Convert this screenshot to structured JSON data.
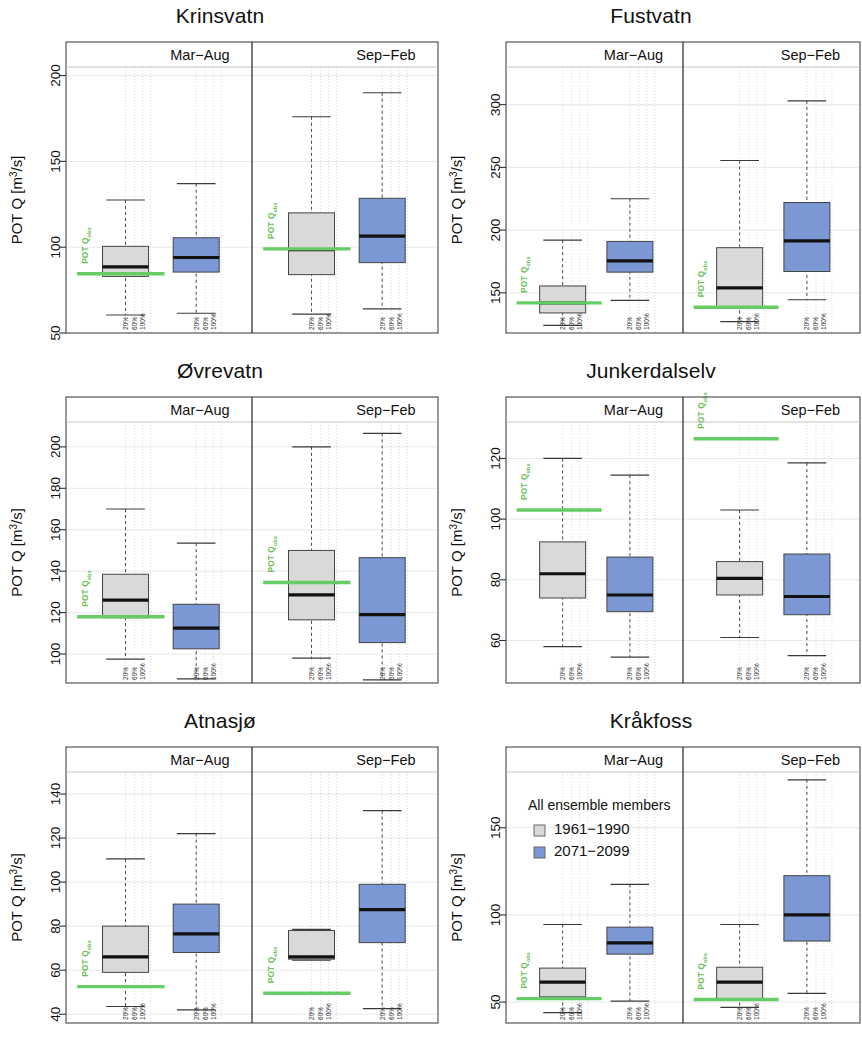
{
  "figure": {
    "panel_count": 6,
    "axis_title": "POT Q [m^3/s]",
    "axis_title_main": "POT Q [m",
    "axis_title_sup": "3",
    "axis_title_tail": "/s]",
    "strip_left": "Mar−Aug",
    "strip_right": "Sep−Feb",
    "obs_label_main": "POT Q",
    "obs_label_sub": "obs",
    "pct_ticks": [
      "20%",
      "60%",
      "100%"
    ],
    "colors": {
      "hist_fill": "#d9d9d9",
      "scen_fill": "#7b97d4",
      "obs_line": "#66cc66",
      "border": "#444444",
      "median": "#111111",
      "grid": "#e8e8e8",
      "frame": "#555555"
    }
  },
  "legend": {
    "title": "All ensemble members",
    "items": [
      {
        "label": "1961−1990",
        "swatch": "#d9d9d9",
        "key": "hist"
      },
      {
        "label": "2071−2099",
        "swatch": "#7b97d4",
        "key": "scen"
      }
    ]
  },
  "chart_data": [
    {
      "type": "box",
      "title": "Krinsvatn",
      "ylabel": "POT Q [m3/s]",
      "ylim": [
        50,
        205
      ],
      "yticks": [
        50,
        100,
        150,
        200
      ],
      "facets": [
        "Mar−Aug",
        "Sep−Feb"
      ],
      "obs_values": {
        "Mar−Aug": 84.5,
        "Sep−Feb": 99.0
      },
      "boxes": [
        {
          "facet": "Mar−Aug",
          "series": "1961−1990",
          "min": 60.5,
          "q1": 83.0,
          "median": 88.5,
          "q3": 100.5,
          "max": 127.5
        },
        {
          "facet": "Mar−Aug",
          "series": "2071−2099",
          "min": 61.5,
          "q1": 85.5,
          "median": 94.0,
          "q3": 105.5,
          "max": 137.0
        },
        {
          "facet": "Sep−Feb",
          "series": "1961−1990",
          "min": 61.0,
          "q1": 84.0,
          "median": 98.5,
          "q3": 120.0,
          "max": 176.0
        },
        {
          "facet": "Sep−Feb",
          "series": "2071−2099",
          "min": 64.0,
          "q1": 91.0,
          "median": 106.5,
          "q3": 128.5,
          "max": 190.0
        }
      ]
    },
    {
      "type": "box",
      "title": "Fustvatn",
      "ylabel": "POT Q [m3/s]",
      "ylim": [
        118,
        330
      ],
      "yticks": [
        150,
        200,
        250,
        300
      ],
      "facets": [
        "Mar−Aug",
        "Sep−Feb"
      ],
      "obs_values": {
        "Mar−Aug": 142.0,
        "Sep−Feb": 138.5
      },
      "boxes": [
        {
          "facet": "Mar−Aug",
          "series": "1961−1990",
          "min": 124.0,
          "q1": 134.0,
          "median": 142.0,
          "q3": 155.5,
          "max": 192.0
        },
        {
          "facet": "Mar−Aug",
          "series": "2071−2099",
          "min": 144.0,
          "q1": 166.5,
          "median": 175.5,
          "q3": 191.0,
          "max": 225.0
        },
        {
          "facet": "Sep−Feb",
          "series": "1961−1990",
          "min": 127.0,
          "q1": 138.0,
          "median": 154.0,
          "q3": 186.0,
          "max": 255.5
        },
        {
          "facet": "Sep−Feb",
          "series": "2071−2099",
          "min": 144.5,
          "q1": 167.0,
          "median": 191.5,
          "q3": 222.0,
          "max": 303.0
        }
      ]
    },
    {
      "type": "box",
      "title": "Øvrevatn",
      "ylabel": "POT Q [m3/s]",
      "ylim": [
        86,
        212
      ],
      "yticks": [
        100,
        120,
        140,
        160,
        180,
        200
      ],
      "facets": [
        "Mar−Aug",
        "Sep−Feb"
      ],
      "obs_values": {
        "Mar−Aug": 118.0,
        "Sep−Feb": 134.5
      },
      "boxes": [
        {
          "facet": "Mar−Aug",
          "series": "1961−1990",
          "min": 97.5,
          "q1": 117.5,
          "median": 126.0,
          "q3": 138.5,
          "max": 170.0
        },
        {
          "facet": "Mar−Aug",
          "series": "2071−2099",
          "min": 88.0,
          "q1": 102.5,
          "median": 112.5,
          "q3": 124.0,
          "max": 153.5
        },
        {
          "facet": "Sep−Feb",
          "series": "1961−1990",
          "min": 98.0,
          "q1": 116.5,
          "median": 128.5,
          "q3": 150.0,
          "max": 200.0
        },
        {
          "facet": "Sep−Feb",
          "series": "2071−2099",
          "min": 87.5,
          "q1": 105.5,
          "median": 119.0,
          "q3": 146.5,
          "max": 206.5
        }
      ]
    },
    {
      "type": "box",
      "title": "Junkerdalselv",
      "ylabel": "POT Q [m3/s]",
      "ylim": [
        46,
        132
      ],
      "yticks": [
        60,
        80,
        100,
        120
      ],
      "facets": [
        "Mar−Aug",
        "Sep−Feb"
      ],
      "obs_values": {
        "Mar−Aug": 103.0,
        "Sep−Feb": 126.5
      },
      "boxes": [
        {
          "facet": "Mar−Aug",
          "series": "1961−1990",
          "min": 58.0,
          "q1": 74.0,
          "median": 82.0,
          "q3": 92.5,
          "max": 120.0
        },
        {
          "facet": "Mar−Aug",
          "series": "2071−2099",
          "min": 54.5,
          "q1": 69.5,
          "median": 75.0,
          "q3": 87.5,
          "max": 114.5
        },
        {
          "facet": "Sep−Feb",
          "series": "1961−1990",
          "min": 61.0,
          "q1": 75.0,
          "median": 80.5,
          "q3": 86.0,
          "max": 103.0
        },
        {
          "facet": "Sep−Feb",
          "series": "2071−2099",
          "min": 55.0,
          "q1": 68.5,
          "median": 74.5,
          "q3": 88.5,
          "max": 118.5
        }
      ]
    },
    {
      "type": "box",
      "title": "Atnasjø",
      "ylabel": "POT Q [m3/s]",
      "ylim": [
        36,
        150
      ],
      "yticks": [
        40,
        60,
        80,
        100,
        120,
        140
      ],
      "facets": [
        "Mar−Aug",
        "Sep−Feb"
      ],
      "obs_values": {
        "Mar−Aug": 52.5,
        "Sep−Feb": 49.5
      },
      "boxes": [
        {
          "facet": "Mar−Aug",
          "series": "1961−1990",
          "min": 43.5,
          "q1": 59.0,
          "median": 66.0,
          "q3": 80.0,
          "max": 110.5
        },
        {
          "facet": "Mar−Aug",
          "series": "2071−2099",
          "min": 42.0,
          "q1": 68.0,
          "median": 76.5,
          "q3": 90.0,
          "max": 122.0
        },
        {
          "facet": "Sep−Feb",
          "series": "1961−1990",
          "min": 64.5,
          "q1": 65.0,
          "median": 66.0,
          "q3": 78.0,
          "max": 78.5
        },
        {
          "facet": "Sep−Feb",
          "series": "2071−2099",
          "min": 42.5,
          "q1": 72.5,
          "median": 87.5,
          "q3": 99.0,
          "max": 132.5
        }
      ]
    },
    {
      "type": "box",
      "title": "Kråkfoss",
      "ylabel": "POT Q [m3/s]",
      "ylim": [
        38,
        182
      ],
      "yticks": [
        50,
        100,
        150
      ],
      "facets": [
        "Mar−Aug",
        "Sep−Feb"
      ],
      "obs_values": {
        "Mar−Aug": 52.0,
        "Sep−Feb": 51.5
      },
      "boxes": [
        {
          "facet": "Mar−Aug",
          "series": "1961−1990",
          "min": 44.0,
          "q1": 53.0,
          "median": 61.5,
          "q3": 69.5,
          "max": 94.5
        },
        {
          "facet": "Mar−Aug",
          "series": "2071−2099",
          "min": 50.5,
          "q1": 77.5,
          "median": 84.0,
          "q3": 93.0,
          "max": 117.5
        },
        {
          "facet": "Sep−Feb",
          "series": "1961−1990",
          "min": 47.0,
          "q1": 52.0,
          "median": 61.5,
          "q3": 70.0,
          "max": 94.5
        },
        {
          "facet": "Sep−Feb",
          "series": "2071−2099",
          "min": 55.0,
          "q1": 85.0,
          "median": 100.0,
          "q3": 122.5,
          "max": 177.5
        }
      ]
    }
  ],
  "layout": {
    "panels": [
      {
        "key": "krinsvatn",
        "x": 0,
        "y": 0,
        "w": 440,
        "h": 355,
        "legend": false
      },
      {
        "key": "fustvatn",
        "x": 440,
        "y": 0,
        "w": 422,
        "h": 355,
        "legend": false
      },
      {
        "key": "ovrevatn",
        "x": 0,
        "y": 355,
        "w": 440,
        "h": 350,
        "legend": false
      },
      {
        "key": "junkerdal",
        "x": 440,
        "y": 355,
        "w": 422,
        "h": 350,
        "legend": false
      },
      {
        "key": "atnasjo",
        "x": 0,
        "y": 705,
        "w": 440,
        "h": 340,
        "legend": false
      },
      {
        "key": "krakfoss",
        "x": 440,
        "y": 705,
        "w": 422,
        "h": 340,
        "legend": true
      }
    ]
  }
}
